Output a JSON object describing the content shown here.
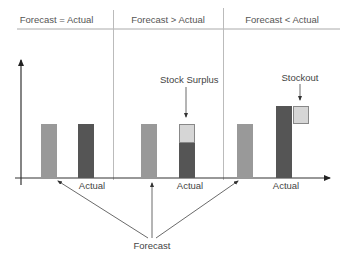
{
  "headers": [
    {
      "label": "Forecast  = Actual"
    },
    {
      "label": "Forecast  > Actual"
    },
    {
      "label": "Forecast  < Actual"
    }
  ],
  "bar_labels": {
    "actual": "Actual",
    "forecast": "Forecast"
  },
  "annotations": {
    "surplus": "Stock Surplus",
    "stockout": "Stockout"
  },
  "colors": {
    "forecast_bar": "#999999",
    "actual_bar": "#555555",
    "gap_box": "#d6d6d6",
    "axis": "#333333",
    "divider": "#bbbbbb"
  },
  "scenarios": [
    {
      "name": "forecast-equals-actual",
      "forecast": 56,
      "actual": 56
    },
    {
      "name": "forecast-greater-than-actual",
      "forecast": 56,
      "actual": 38,
      "surplus": 18
    },
    {
      "name": "forecast-less-than-actual",
      "forecast": 56,
      "actual": 74,
      "stockout": 18
    }
  ]
}
